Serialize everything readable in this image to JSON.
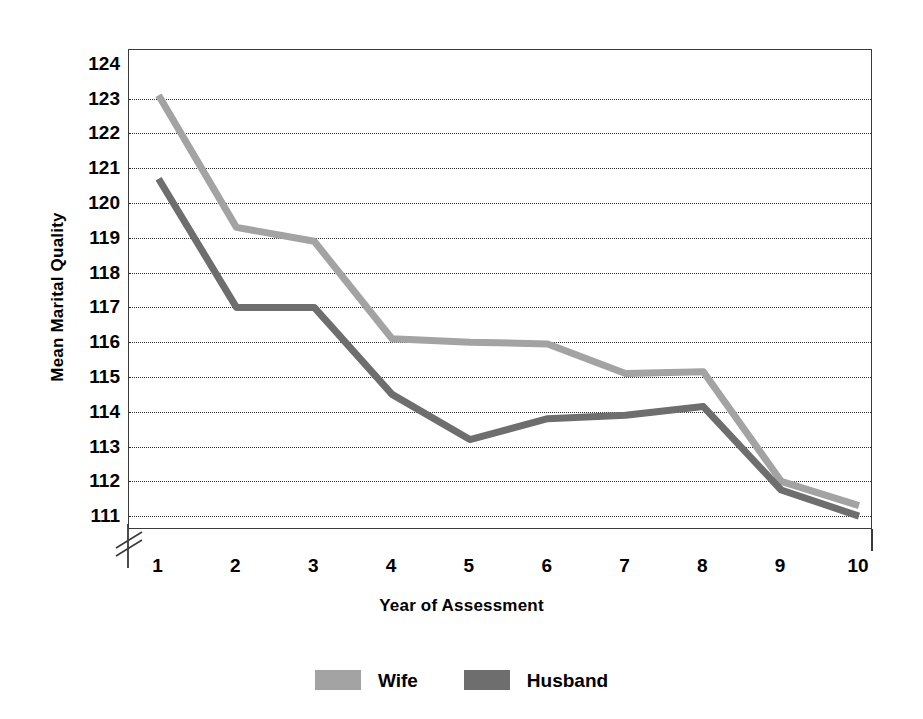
{
  "chart_data": {
    "type": "line",
    "title": "",
    "xlabel": "Year of Assessment",
    "ylabel": "Mean Marital Quality",
    "categories": [
      1,
      2,
      3,
      4,
      5,
      6,
      7,
      8,
      9,
      10
    ],
    "x_tick_labels": [
      "1",
      "2",
      "3",
      "4",
      "5",
      "6",
      "7",
      "8",
      "9",
      "10"
    ],
    "y_tick_labels": [
      "124",
      "123",
      "122",
      "121",
      "120",
      "119",
      "118",
      "117",
      "116",
      "115",
      "114",
      "113",
      "112",
      "111"
    ],
    "y_ticks": [
      124,
      123,
      122,
      121,
      120,
      119,
      118,
      117,
      116,
      115,
      114,
      113,
      112,
      111
    ],
    "ylim": [
      110.6,
      124.4
    ],
    "xlim": [
      0.62,
      10.18
    ],
    "grid": true,
    "grid_style": "dotted-horizontal",
    "y_axis_break": true,
    "legend_position": "bottom-center",
    "series": [
      {
        "name": "Wife",
        "color": "#a3a3a3",
        "values": [
          123.1,
          119.3,
          118.9,
          116.1,
          116.0,
          115.95,
          115.1,
          115.15,
          112.0,
          111.3
        ]
      },
      {
        "name": "Husband",
        "color": "#6e6e6e",
        "values": [
          120.7,
          117.0,
          117.0,
          114.5,
          113.2,
          113.8,
          113.9,
          114.15,
          111.75,
          111.0
        ]
      }
    ]
  },
  "legend": {
    "items": [
      {
        "label": "Wife",
        "color": "#a3a3a3"
      },
      {
        "label": "Husband",
        "color": "#6e6e6e"
      }
    ]
  },
  "axes": {
    "y_title": "Mean Marital Quality",
    "x_title": "Year of Assessment"
  }
}
